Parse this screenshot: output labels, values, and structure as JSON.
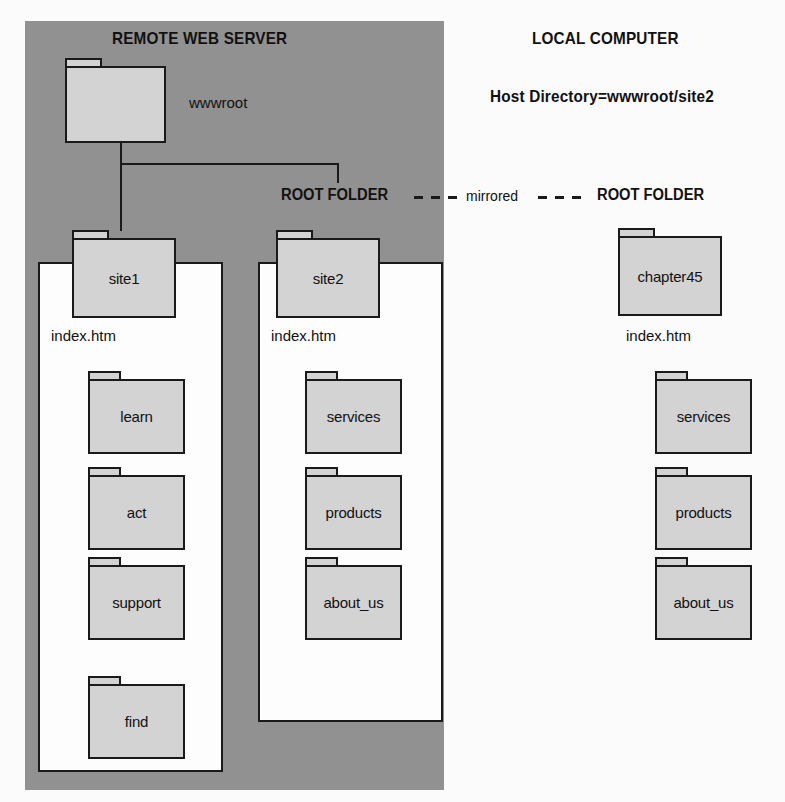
{
  "diagram": {
    "title_left": "REMOTE WEB SERVER",
    "title_right": "LOCAL COMPUTER",
    "host_directory": "Host Directory=wwwroot/site2",
    "root_folder_left": "ROOT FOLDER",
    "root_folder_right": "ROOT FOLDER",
    "mirrored_label": "mirrored",
    "colors": {
      "server_panel": "#919191",
      "folder_fill": "#d3d3d3",
      "outline": "#1a1a1a",
      "white_box": "#fdfdfd",
      "page_background": "#fbfbfb"
    }
  },
  "server": {
    "root": {
      "name": "wwwroot",
      "caption": "wwwroot"
    },
    "sites": [
      {
        "id": "site1",
        "name": "site1",
        "index_file": "index.htm",
        "children": [
          {
            "name": "learn"
          },
          {
            "name": "act"
          },
          {
            "name": "support"
          },
          {
            "name": "find"
          }
        ]
      },
      {
        "id": "site2",
        "name": "site2",
        "index_file": "index.htm",
        "children": [
          {
            "name": "services"
          },
          {
            "name": "products"
          },
          {
            "name": "about_us"
          }
        ]
      }
    ]
  },
  "local": {
    "root": {
      "name": "chapter45",
      "index_file": "index.htm"
    },
    "children": [
      {
        "name": "services"
      },
      {
        "name": "products"
      },
      {
        "name": "about_us"
      }
    ]
  }
}
